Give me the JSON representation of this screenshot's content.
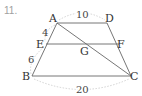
{
  "problem": {
    "number": "11."
  },
  "diagram": {
    "type": "trapezoid",
    "points": {
      "A": {
        "label": "A",
        "x": 57,
        "y": 23
      },
      "D": {
        "label": "D",
        "x": 107,
        "y": 23
      },
      "E": {
        "label": "E",
        "x": 46,
        "y": 44
      },
      "F": {
        "label": "F",
        "x": 118,
        "y": 44
      },
      "G": {
        "label": "G",
        "x": 85,
        "y": 44
      },
      "B": {
        "label": "B",
        "x": 32,
        "y": 76
      },
      "C": {
        "label": "C",
        "x": 131,
        "y": 76
      }
    },
    "segments": [
      "AD",
      "EF",
      "BC",
      "AB",
      "DC",
      "AC"
    ],
    "measures": {
      "AD": "10",
      "AE": "4",
      "EB": "6",
      "BC": "20"
    }
  }
}
